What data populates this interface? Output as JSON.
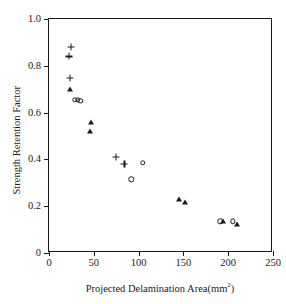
{
  "chart_data": {
    "type": "scatter",
    "title": "",
    "xlabel": "Projected Delamination Area(mm²)",
    "xlabel_main": "Projected Delamination Area(mm",
    "xlabel_sup": "2",
    "xlabel_tail": ")",
    "ylabel": "Strength Retention Factor",
    "xlim": [
      0,
      250
    ],
    "ylim": [
      0,
      1.0
    ],
    "xticks": [
      0,
      50,
      100,
      150,
      200,
      250
    ],
    "xticklabels": [
      "0",
      "50",
      "100",
      "150",
      "200",
      "250"
    ],
    "yticks": [
      0,
      0.2,
      0.4,
      0.6,
      0.8,
      1.0
    ],
    "yticklabels": [
      "0",
      "0.2",
      "0.4",
      "0.6",
      "0.8",
      "1.0"
    ],
    "grid": false,
    "legend": "none",
    "marker_color": "#1a1a1a",
    "series": [
      {
        "name": "plus",
        "marker": "plus",
        "points": [
          {
            "x": 24,
            "y": 0.88
          },
          {
            "x": 22,
            "y": 0.84
          },
          {
            "x": 23,
            "y": 0.75
          },
          {
            "x": 75,
            "y": 0.41
          },
          {
            "x": 84,
            "y": 0.38
          }
        ]
      },
      {
        "name": "triangle",
        "marker": "triangle",
        "points": [
          {
            "x": 23,
            "y": 0.7
          },
          {
            "x": 47,
            "y": 0.56
          },
          {
            "x": 46,
            "y": 0.52
          },
          {
            "x": 145,
            "y": 0.23
          },
          {
            "x": 152,
            "y": 0.22
          },
          {
            "x": 194,
            "y": 0.135
          },
          {
            "x": 210,
            "y": 0.125
          }
        ]
      },
      {
        "name": "circle",
        "marker": "circle",
        "points": [
          {
            "x": 29,
            "y": 0.655
          },
          {
            "x": 32,
            "y": 0.655
          },
          {
            "x": 35,
            "y": 0.65
          },
          {
            "x": 92,
            "y": 0.315
          },
          {
            "x": 105,
            "y": 0.385
          },
          {
            "x": 191,
            "y": 0.135
          },
          {
            "x": 205,
            "y": 0.135
          }
        ]
      }
    ]
  }
}
